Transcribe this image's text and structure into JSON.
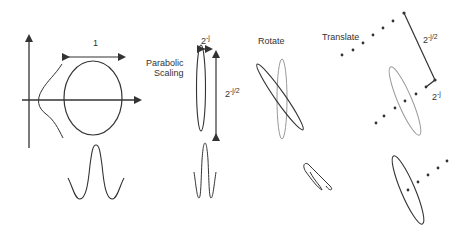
{
  "diagram": {
    "panels": [
      {
        "id": "original",
        "labels": {
          "width": "1"
        }
      },
      {
        "id": "scaling",
        "title": "Parabolic Scaling",
        "title_line1": "Parabolic",
        "title_line2": "Scaling",
        "labels": {
          "width_base": "2",
          "width_exp": "-j",
          "height_base": "2",
          "height_exp": "-j/2"
        }
      },
      {
        "id": "rotate",
        "title": "Rotate"
      },
      {
        "id": "translate",
        "title": "Translate",
        "labels": {
          "long_base": "2",
          "long_exp": "-j/2",
          "short_base": "2",
          "short_exp": "-j"
        }
      }
    ],
    "colors": {
      "stroke": "#333333",
      "light_stroke": "#888888",
      "background": "#ffffff"
    }
  }
}
